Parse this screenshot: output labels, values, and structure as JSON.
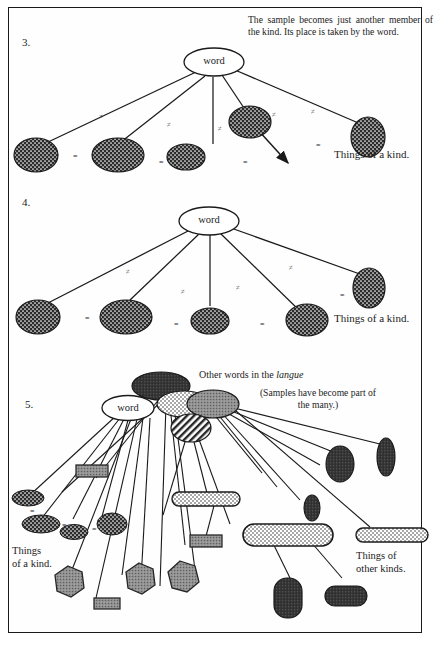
{
  "page": {
    "width": 434,
    "height": 651,
    "background": "#ffffff",
    "frame_color": "#1a1a1a"
  },
  "colors": {
    "ink": "#1c1c1c",
    "dark_fill": "#2b2b2b",
    "gray_fill": "#8a8a8a",
    "mid_gray": "#6e6e6e",
    "white": "#ffffff",
    "line": "#1a1a1a"
  },
  "diagrams": [
    {
      "number": "3.",
      "note": "The sample becomes just another member of the kind. Its place is taken by the word.",
      "root_label": "word",
      "kind_label": "Things of a kind.",
      "relations": [
        "≠",
        "≠",
        "≠",
        "≠",
        "≠"
      ],
      "equalities": [
        "=",
        "=",
        "=",
        "="
      ],
      "node_count": 5,
      "has_arrow": true
    },
    {
      "number": "4.",
      "note": "",
      "root_label": "word",
      "kind_label": "Things of a kind.",
      "relations": [
        "≠",
        "≠",
        "≠",
        "≠"
      ],
      "equalities": [
        "=",
        "=",
        "=",
        "="
      ],
      "node_count": 5,
      "has_arrow": false
    },
    {
      "number": "5.",
      "root_label": "word",
      "other_words_label_prefix": "Other words in the ",
      "other_words_label_italic": "langue",
      "samples_note": "(Samples have become part of the many.)",
      "kind_label_line1": "Things",
      "kind_label_line2": "of a kind.",
      "other_kinds_line1": "Things of",
      "other_kinds_line2": "other kinds.",
      "equalities": [
        "=",
        "=",
        "="
      ]
    }
  ]
}
